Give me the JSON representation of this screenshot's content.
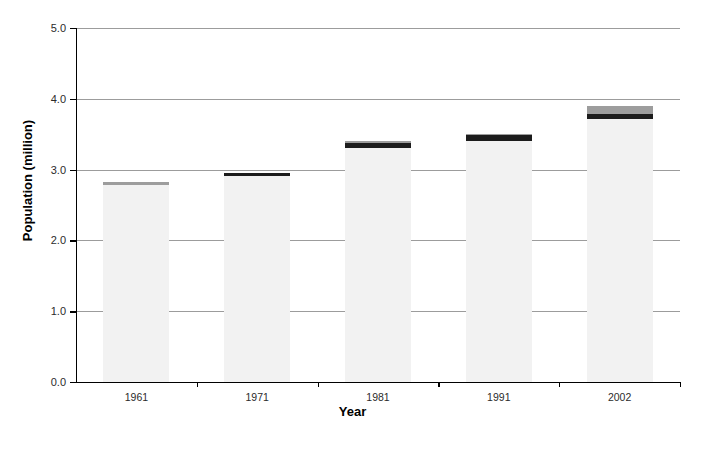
{
  "chart_data": {
    "type": "bar",
    "stacked": true,
    "title": "",
    "xlabel": "Year",
    "ylabel": "Population (million)",
    "categories": [
      "1961",
      "1971",
      "1981",
      "1991",
      "2002"
    ],
    "x_tick_labels": [
      "1961",
      "1971",
      "1981",
      "1991",
      "2002"
    ],
    "y_tick_labels": [
      "0.0",
      "1.0",
      "2.0",
      "3.0",
      "4.0",
      "5.0"
    ],
    "y_tick_values": [
      0.0,
      1.0,
      2.0,
      3.0,
      4.0,
      5.0
    ],
    "ylim": [
      0.0,
      5.0
    ],
    "grid": "horizontal",
    "legend": "none",
    "totals": [
      2.82,
      2.96,
      3.41,
      3.5,
      3.9
    ],
    "series": [
      {
        "name": "main-population",
        "color": "#f2f2f2",
        "values": [
          2.79,
          2.91,
          3.3,
          3.41,
          3.71
        ]
      },
      {
        "name": "dark-band",
        "color": "#1c1c1c",
        "values": [
          0.0,
          0.05,
          0.08,
          0.08,
          0.08
        ]
      },
      {
        "name": "grey-band",
        "color": "#9d9d9d",
        "values": [
          0.03,
          0.0,
          0.03,
          0.01,
          0.11
        ]
      }
    ]
  },
  "axes": {
    "y_title": "Population (million)",
    "x_title": "Year"
  }
}
